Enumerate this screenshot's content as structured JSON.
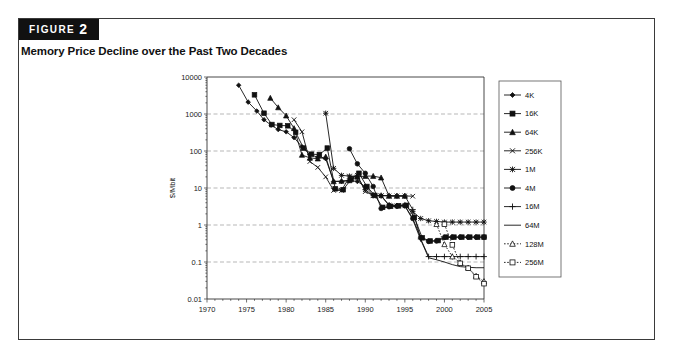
{
  "figure": {
    "badge_word": "FIGURE",
    "badge_number": "2",
    "title": "Memory Price Decline over the Past Two Decades"
  },
  "chart_data": {
    "type": "line",
    "title": "Memory Price Decline over the Past Two Decades",
    "xlabel": "",
    "ylabel": "$/Mbit",
    "yscale": "log",
    "xlim": [
      1970,
      2005
    ],
    "ylim": [
      0.01,
      10000
    ],
    "xticks": [
      1970,
      1975,
      1980,
      1985,
      1990,
      1995,
      2000,
      2005
    ],
    "yticks": [
      0.01,
      0.1,
      1,
      10,
      100,
      1000,
      10000
    ],
    "ytick_labels": [
      "0.01",
      "0.1",
      "1",
      "10",
      "100",
      "1000",
      "10000"
    ],
    "grid": "horizontal",
    "legend_position": "right",
    "series": [
      {
        "name": "4K",
        "marker": "diamond",
        "linestyle": "solid",
        "points": [
          [
            1974.0,
            6000
          ],
          [
            1975.2,
            2100
          ],
          [
            1976.3,
            1200
          ],
          [
            1977.2,
            700
          ],
          [
            1978.1,
            500
          ],
          [
            1979.0,
            380
          ],
          [
            1980.0,
            330
          ],
          [
            1981.0,
            230
          ],
          [
            1982.0,
            130
          ],
          [
            1983.0,
            80
          ],
          [
            1984.0,
            68
          ],
          [
            1985.0,
            62
          ],
          [
            1986.0,
            15
          ],
          [
            1987.0,
            15
          ],
          [
            1988.0,
            16
          ],
          [
            1989.0,
            15
          ],
          [
            1990.0,
            11
          ],
          [
            1991.0,
            6.5
          ],
          [
            1992.0,
            6.2
          ],
          [
            1993.0,
            3.5
          ],
          [
            1994.0,
            3.4
          ],
          [
            1995.0,
            3.5
          ]
        ]
      },
      {
        "name": "16K",
        "marker": "square",
        "linestyle": "solid",
        "points": [
          [
            1976.0,
            3300
          ],
          [
            1977.2,
            1050
          ],
          [
            1978.2,
            520
          ],
          [
            1979.2,
            490
          ],
          [
            1980.2,
            480
          ],
          [
            1981.2,
            320
          ],
          [
            1982.2,
            120
          ],
          [
            1983.2,
            82
          ],
          [
            1984.2,
            80
          ],
          [
            1985.2,
            120
          ],
          [
            1986.2,
            9.5
          ],
          [
            1987.2,
            9.0
          ],
          [
            1988.2,
            17
          ],
          [
            1989.2,
            25
          ],
          [
            1990.2,
            11
          ],
          [
            1991.2,
            6.3
          ],
          [
            1992.2,
            3.0
          ],
          [
            1993.2,
            3.2
          ],
          [
            1994.2,
            3.3
          ],
          [
            1995.2,
            3.4
          ],
          [
            1996.2,
            1.6
          ],
          [
            1997.2,
            0.45
          ],
          [
            1998.2,
            0.37
          ],
          [
            1999.2,
            0.38
          ],
          [
            2000.2,
            0.47
          ],
          [
            2001.2,
            0.47
          ],
          [
            2002.2,
            0.47
          ],
          [
            2003.2,
            0.47
          ],
          [
            2004.2,
            0.47
          ],
          [
            2005.0,
            0.47
          ]
        ]
      },
      {
        "name": "64K",
        "marker": "triangle",
        "linestyle": "solid",
        "points": [
          [
            1978.0,
            2700
          ],
          [
            1979.0,
            1500
          ],
          [
            1980.0,
            900
          ],
          [
            1981.0,
            410
          ],
          [
            1982.0,
            78
          ],
          [
            1983.0,
            65
          ],
          [
            1984.0,
            62
          ],
          [
            1985.0,
            70
          ],
          [
            1986.0,
            15
          ],
          [
            1987.0,
            15.5
          ],
          [
            1988.0,
            16
          ],
          [
            1989.0,
            20
          ],
          [
            1990.0,
            21
          ],
          [
            1991.0,
            21
          ],
          [
            1992.0,
            19
          ],
          [
            1993.0,
            6.1
          ],
          [
            1994.0,
            6.1
          ],
          [
            1995.0,
            6.1
          ]
        ]
      },
      {
        "name": "256K",
        "marker": "x-bar",
        "linestyle": "solid",
        "points": [
          [
            1981.0,
            700
          ],
          [
            1982.0,
            330
          ],
          [
            1983.0,
            52
          ],
          [
            1984.0,
            36
          ],
          [
            1985.0,
            20
          ],
          [
            1986.0,
            8.6
          ],
          [
            1987.0,
            8.6
          ],
          [
            1988.0,
            20
          ],
          [
            1989.0,
            22
          ],
          [
            1990.0,
            8.0
          ],
          [
            1991.0,
            6.3
          ],
          [
            1992.0,
            6.2
          ],
          [
            1993.0,
            6.1
          ],
          [
            1994.0,
            6.1
          ],
          [
            1995.0,
            6.1
          ],
          [
            1996.0,
            6.0
          ]
        ]
      },
      {
        "name": "1M",
        "marker": "asterisk",
        "linestyle": "solid",
        "points": [
          [
            1985.0,
            1050
          ],
          [
            1986.0,
            34
          ],
          [
            1987.0,
            22
          ],
          [
            1988.0,
            21
          ],
          [
            1989.0,
            20
          ],
          [
            1990.0,
            9.0
          ],
          [
            1991.0,
            6.2
          ],
          [
            1992.0,
            6.1
          ],
          [
            1993.0,
            3.4
          ],
          [
            1994.0,
            3.3
          ],
          [
            1995.0,
            3.3
          ],
          [
            1996.0,
            2.3
          ],
          [
            1997.0,
            1.5
          ],
          [
            1998.0,
            1.3
          ],
          [
            1999.0,
            1.25
          ],
          [
            2000.0,
            1.2
          ],
          [
            2001.0,
            1.2
          ],
          [
            2002.0,
            1.2
          ],
          [
            2003.0,
            1.2
          ],
          [
            2004.0,
            1.2
          ],
          [
            2005.0,
            1.2
          ]
        ]
      },
      {
        "name": "4M",
        "marker": "circle",
        "linestyle": "solid",
        "points": [
          [
            1988.0,
            115
          ],
          [
            1989.0,
            45
          ],
          [
            1990.0,
            25
          ],
          [
            1991.0,
            11
          ],
          [
            1992.0,
            2.8
          ],
          [
            1993.0,
            3.1
          ],
          [
            1994.0,
            3.2
          ],
          [
            1995.0,
            3.3
          ],
          [
            1996.0,
            1.5
          ],
          [
            1997.0,
            0.46
          ],
          [
            1998.0,
            0.36
          ],
          [
            1999.0,
            0.37
          ],
          [
            2000.0,
            0.46
          ],
          [
            2001.0,
            0.47
          ],
          [
            2002.0,
            0.47
          ],
          [
            2003.0,
            0.47
          ],
          [
            2004.0,
            0.47
          ],
          [
            2005.0,
            0.47
          ]
        ]
      },
      {
        "name": "16M",
        "marker": "plus",
        "linestyle": "solid",
        "points": [
          [
            1992.0,
            6.3
          ],
          [
            1993.0,
            6.2
          ],
          [
            1994.0,
            6.1
          ],
          [
            1995.0,
            6.1
          ],
          [
            1996.0,
            2.6
          ],
          [
            1997.0,
            0.42
          ],
          [
            1998.0,
            0.14
          ],
          [
            1999.0,
            0.14
          ],
          [
            2000.0,
            0.14
          ],
          [
            2001.0,
            0.14
          ],
          [
            2002.0,
            0.14
          ],
          [
            2003.0,
            0.14
          ],
          [
            2004.0,
            0.14
          ],
          [
            2005.0,
            0.14
          ]
        ]
      },
      {
        "name": "64M",
        "marker": "none",
        "linestyle": "solid",
        "points": [
          [
            1995.0,
            3.3
          ],
          [
            1996.0,
            1.4
          ],
          [
            1997.0,
            0.4
          ],
          [
            1998.0,
            0.13
          ],
          [
            1999.0,
            0.115
          ],
          [
            2000.0,
            0.1
          ],
          [
            2001.0,
            0.085
          ],
          [
            2002.0,
            0.075
          ],
          [
            2003.0,
            0.072
          ],
          [
            2004.0,
            0.07
          ],
          [
            2005.0,
            0.07
          ]
        ]
      },
      {
        "name": "128M",
        "marker": "open-triangle",
        "linestyle": "dotted",
        "points": [
          [
            1999.0,
            1.05
          ],
          [
            2000.0,
            0.3
          ],
          [
            2001.0,
            0.14
          ],
          [
            2002.0,
            0.095
          ],
          [
            2003.0,
            0.07
          ],
          [
            2004.0,
            0.042
          ],
          [
            2005.0,
            0.03
          ]
        ]
      },
      {
        "name": "256M",
        "marker": "open-square",
        "linestyle": "dotted",
        "points": [
          [
            2000.0,
            1.05
          ],
          [
            2001.0,
            0.29
          ],
          [
            2002.0,
            0.092
          ],
          [
            2003.0,
            0.068
          ],
          [
            2004.0,
            0.04
          ],
          [
            2005.0,
            0.026
          ]
        ]
      }
    ]
  }
}
